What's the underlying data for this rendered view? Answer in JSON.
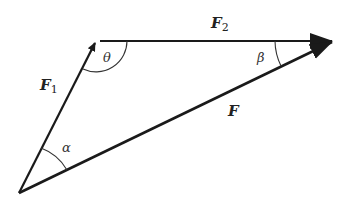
{
  "diagram": {
    "type": "vector-triangle",
    "vertices": {
      "origin": [
        19,
        193
      ],
      "f1_tip": [
        96,
        41
      ],
      "f2_tip": [
        333,
        41
      ]
    },
    "vectors": [
      {
        "id": "F1",
        "label": "F",
        "subscript": "1",
        "from": "origin",
        "to": "f1_tip"
      },
      {
        "id": "F2",
        "label": "F",
        "subscript": "2",
        "from": "f1_tip",
        "to": "f2_tip"
      },
      {
        "id": "F",
        "label": "F",
        "subscript": "",
        "from": "origin",
        "to": "f2_tip"
      }
    ],
    "angles": [
      {
        "id": "theta",
        "symbol": "θ",
        "vertex": "f1_tip",
        "between": [
          "F1",
          "F2"
        ]
      },
      {
        "id": "beta",
        "symbol": "β",
        "vertex": "f2_tip",
        "between": [
          "F2",
          "F"
        ]
      },
      {
        "id": "alpha",
        "symbol": "α",
        "vertex": "origin",
        "between": [
          "F1",
          "F"
        ]
      }
    ],
    "colors": {
      "stroke": "#1a1a1a",
      "background": "#ffffff"
    }
  }
}
